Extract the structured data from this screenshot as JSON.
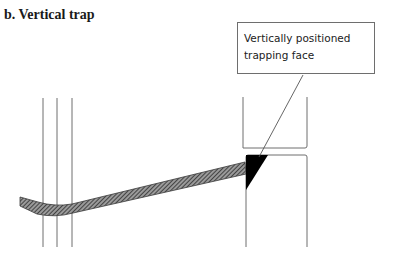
{
  "figure": {
    "title": "b. Vertical trap",
    "callout": {
      "line1": "Vertically positioned",
      "line2": "trapping face"
    },
    "colors": {
      "line": "#6e6e6e",
      "hatch": "#3a3a3a",
      "trap_face": "#000000"
    }
  }
}
